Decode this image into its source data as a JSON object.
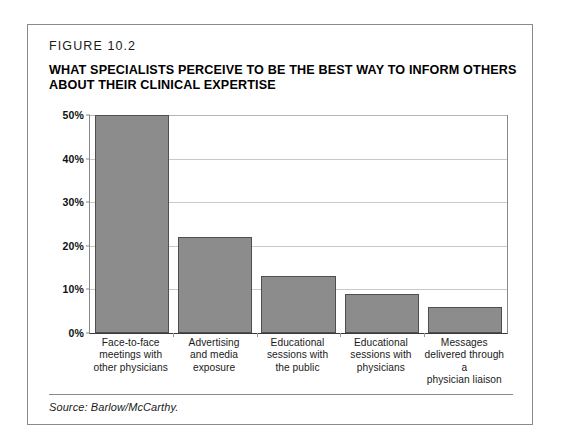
{
  "figure": {
    "label": "FIGURE 10.2",
    "title": "WHAT SPECIALISTS PERCEIVE TO BE THE BEST WAY TO INFORM OTHERS ABOUT THEIR CLINICAL EXPERTISE",
    "source": "Source: Barlow/McCarthy."
  },
  "colors": {
    "bar_fill": "#8c8c8c",
    "bar_stroke": "#4f4f4f",
    "gridline": "#c9c9c9",
    "frame": "#8a8a8a",
    "axis": "#3a3a3a",
    "text": "#000000",
    "background": "#ffffff"
  },
  "axis": {
    "y_ticks": [
      "0%",
      "10%",
      "20%",
      "30%",
      "40%",
      "50%"
    ],
    "y_tick_values": [
      0,
      10,
      20,
      30,
      40,
      50
    ]
  },
  "chart_data": {
    "type": "bar",
    "title": "WHAT SPECIALISTS PERCEIVE TO BE THE BEST WAY TO INFORM OTHERS ABOUT THEIR CLINICAL EXPERTISE",
    "subtitle": "FIGURE 10.2",
    "categories": [
      "Face-to-face meetings with other physicians",
      "Advertising and media exposure",
      "Educational sessions with the public",
      "Educational sessions with physicians",
      "Messages delivered through a physician liaison"
    ],
    "category_lines": [
      [
        "Face-to-face",
        "meetings with",
        "other physicians"
      ],
      [
        "Advertising",
        "and media",
        "exposure"
      ],
      [
        "Educational",
        "sessions with",
        "the public"
      ],
      [
        "Educational",
        "sessions with",
        "physicians"
      ],
      [
        "Messages",
        "delivered through a",
        "physician liaison"
      ]
    ],
    "values": [
      50,
      22,
      13,
      9,
      6
    ],
    "value_labels": [
      "50%",
      "22%",
      "13%",
      "9%",
      "6%"
    ],
    "xlabel": "",
    "ylabel": "",
    "ylim": [
      0,
      50
    ],
    "ytick_step": 10,
    "grid": true,
    "legend": "none",
    "source": "Source: Barlow/McCarthy."
  }
}
